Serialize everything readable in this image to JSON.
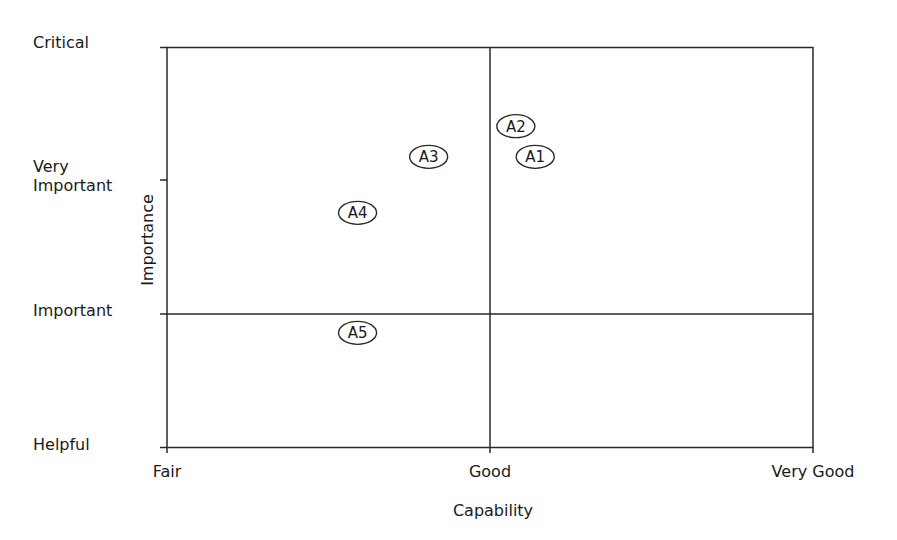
{
  "chart_data": {
    "type": "scatter",
    "title": "",
    "xlabel": "Capability",
    "ylabel": "Importance",
    "x_tick_labels": [
      "Fair",
      "Good",
      "Very Good"
    ],
    "y_tick_labels": [
      "Helpful",
      "Important",
      "Very Important",
      "Critical"
    ],
    "xlim": [
      0,
      2
    ],
    "ylim": [
      0,
      3
    ],
    "grid": false,
    "quadrant_lines": {
      "x": 1,
      "y": 1
    },
    "legend": null,
    "points": [
      {
        "label": "A1",
        "x": 1.14,
        "y": 2.18
      },
      {
        "label": "A2",
        "x": 1.08,
        "y": 2.41
      },
      {
        "label": "A3",
        "x": 0.81,
        "y": 2.18
      },
      {
        "label": "A4",
        "x": 0.59,
        "y": 1.76
      },
      {
        "label": "A5",
        "x": 0.59,
        "y": 0.86
      }
    ]
  },
  "labels": {
    "y": {
      "critical": "Critical",
      "very": "Very",
      "important_2": "Important",
      "important": "Important",
      "helpful": "Helpful"
    },
    "x": {
      "fair": "Fair",
      "good": "Good",
      "very_good": "Very Good"
    },
    "xlabel": "Capability",
    "ylabel": "Importance"
  },
  "colors": {
    "line": "#2a2a2a",
    "text": "#1a1a1a",
    "background": "#ffffff"
  }
}
